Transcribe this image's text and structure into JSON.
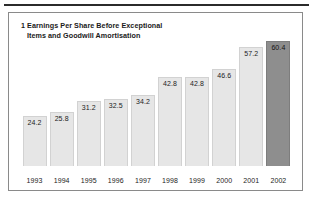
{
  "chart_data": {
    "type": "bar",
    "title": "1 Earnings Per Share Before Exceptional Items and Goodwill Amortisation",
    "title_lines": [
      "1 Earnings Per Share Before Exceptional",
      "Items and Goodwill Amortisation"
    ],
    "categories": [
      "1993",
      "1994",
      "1995",
      "1996",
      "1997",
      "1998",
      "1999",
      "2000",
      "2001",
      "2002"
    ],
    "values": [
      24.2,
      25.8,
      31.2,
      32.5,
      34.2,
      42.8,
      42.8,
      46.6,
      57.2,
      60.4
    ],
    "value_labels": [
      "24.2",
      "25.8",
      "31.2",
      "32.5",
      "34.2",
      "42.8",
      "42.8",
      "46.6",
      "57.2",
      "60.4"
    ],
    "xlabel": "",
    "ylabel": "",
    "ylim": [
      0,
      66
    ],
    "grid": false,
    "legend": false,
    "bar_colors": [
      "#e6e6e6",
      "#e6e6e6",
      "#e6e6e6",
      "#e6e6e6",
      "#e6e6e6",
      "#e6e6e6",
      "#e6e6e6",
      "#e6e6e6",
      "#e6e6e6",
      "#8e8e8e"
    ],
    "highlight_index": 9,
    "colors": {
      "bar_light": "#e6e6e6",
      "bar_dark": "#8e8e8e",
      "frame": "#8a8a8a",
      "rule": "#2b2b2b",
      "text": "#1c1c1c",
      "background": "#ffffff"
    }
  }
}
